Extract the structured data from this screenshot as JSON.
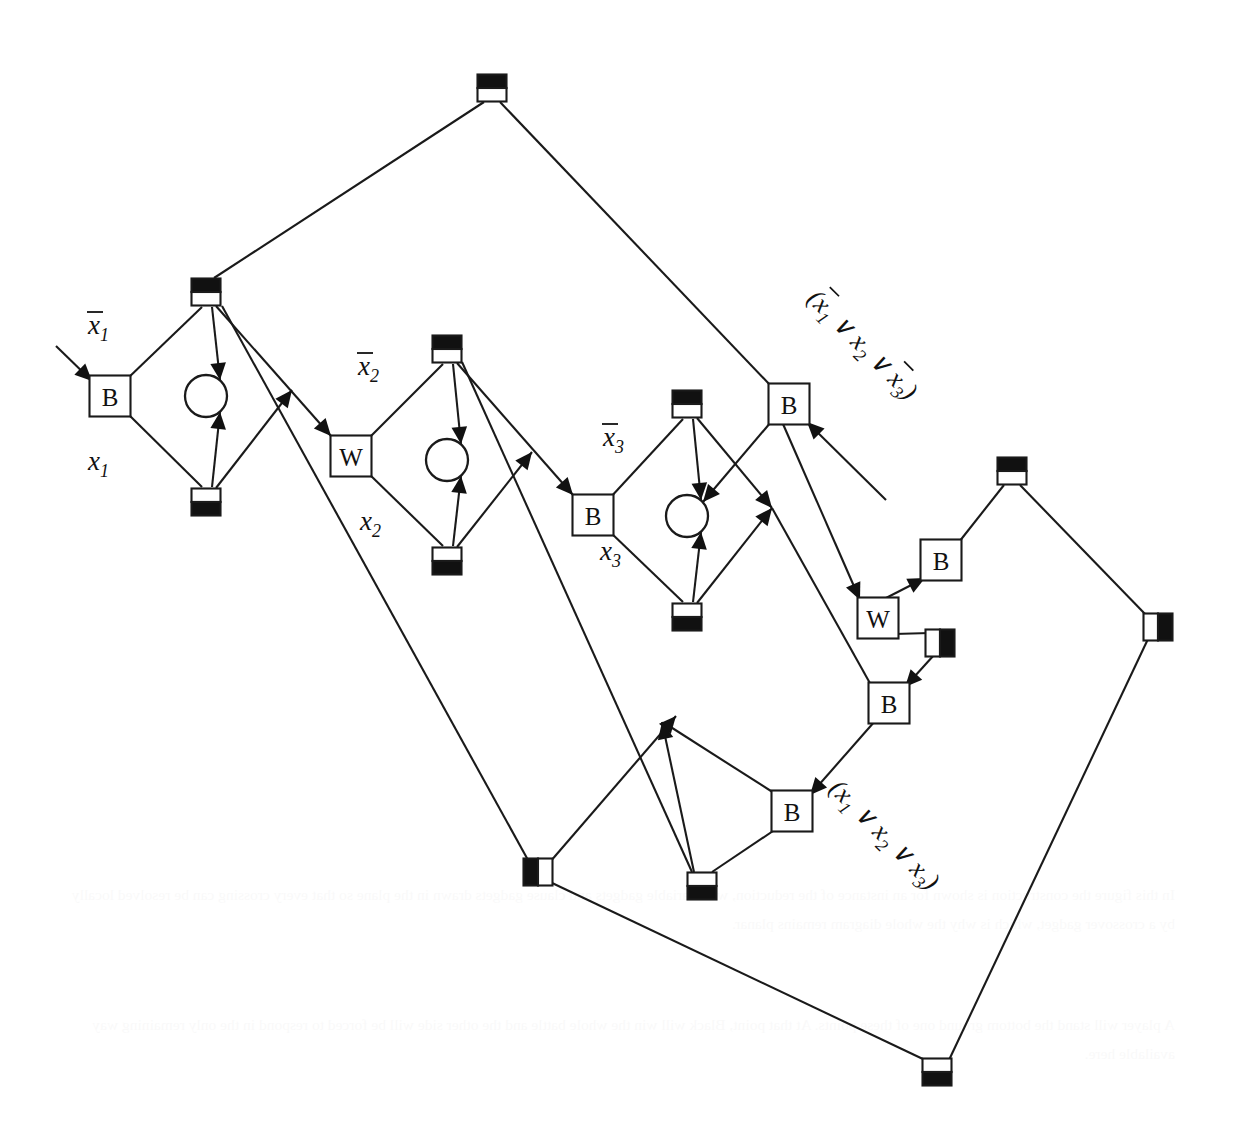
{
  "figure": {
    "kind": "sat-reduction-gadget-diagram",
    "background": "#ffffff",
    "ink": "#1a1a1a",
    "width": 1235,
    "height": 1139
  },
  "gate_labels": {
    "black": "B",
    "white": "W"
  },
  "variable_labels": [
    {
      "id": "not-x1",
      "base": "x",
      "sub": "1",
      "overline": true,
      "text": "x1",
      "x": 88,
      "y": 334
    },
    {
      "id": "x1",
      "base": "x",
      "sub": "1",
      "overline": false,
      "text": "x1",
      "x": 88,
      "y": 470
    },
    {
      "id": "not-x2",
      "base": "x",
      "sub": "2",
      "overline": true,
      "text": "x2",
      "x": 358,
      "y": 375
    },
    {
      "id": "x2",
      "base": "x",
      "sub": "2",
      "overline": false,
      "text": "x2",
      "x": 360,
      "y": 530
    },
    {
      "id": "not-x3",
      "base": "x",
      "sub": "3",
      "overline": true,
      "text": "x3",
      "x": 603,
      "y": 446
    },
    {
      "id": "x3",
      "base": "x",
      "sub": "3",
      "overline": false,
      "text": "x3",
      "x": 600,
      "y": 560
    }
  ],
  "clauses": [
    {
      "id": "clause-1",
      "text": "(x1 V x2 V x3)",
      "display": "( x̅1 ∨ x2 ∨ x̅3 )",
      "x": 806,
      "y": 300,
      "rotate": 45
    },
    {
      "id": "clause-2",
      "text": "(x1 V x2 V x3)",
      "display": "( x1 ∨ x2 ∨ x3 )",
      "x": 828,
      "y": 790,
      "rotate": 45
    }
  ],
  "gates": [
    {
      "id": "gate-b-1",
      "label": "B",
      "x": 110,
      "y": 396
    },
    {
      "id": "gate-w-1",
      "label": "W",
      "x": 351,
      "y": 456
    },
    {
      "id": "gate-b-2",
      "label": "B",
      "x": 593,
      "y": 515
    },
    {
      "id": "gate-b-3",
      "label": "B",
      "x": 789,
      "y": 404
    },
    {
      "id": "gate-b-4",
      "label": "B",
      "x": 941,
      "y": 560
    },
    {
      "id": "gate-w-2",
      "label": "W",
      "x": 878,
      "y": 618
    },
    {
      "id": "gate-b-5",
      "label": "B",
      "x": 889,
      "y": 703
    },
    {
      "id": "gate-b-6",
      "label": "B",
      "x": 792,
      "y": 811
    }
  ],
  "circles": [
    {
      "id": "circle-1",
      "x": 206,
      "y": 396,
      "r": 21
    },
    {
      "id": "circle-2",
      "x": 447,
      "y": 460,
      "r": 21
    },
    {
      "id": "circle-3",
      "x": 687,
      "y": 516,
      "r": 21
    }
  ],
  "split_nodes": [
    {
      "id": "node-top",
      "x": 492,
      "y": 88,
      "orientation": "horizontal",
      "first": "black",
      "second": "white"
    },
    {
      "id": "node-x1-upper",
      "x": 206,
      "y": 292,
      "orientation": "horizontal",
      "first": "black",
      "second": "white"
    },
    {
      "id": "node-x1-lower",
      "x": 206,
      "y": 502,
      "orientation": "horizontal",
      "first": "white",
      "second": "black"
    },
    {
      "id": "node-x2-upper",
      "x": 447,
      "y": 349,
      "orientation": "horizontal",
      "first": "black",
      "second": "white"
    },
    {
      "id": "node-x2-lower",
      "x": 447,
      "y": 561,
      "orientation": "horizontal",
      "first": "white",
      "second": "black"
    },
    {
      "id": "node-x3-upper",
      "x": 687,
      "y": 404,
      "orientation": "horizontal",
      "first": "black",
      "second": "white"
    },
    {
      "id": "node-x3-lower",
      "x": 687,
      "y": 617,
      "orientation": "horizontal",
      "first": "white",
      "second": "black"
    },
    {
      "id": "node-right-upper",
      "x": 1012,
      "y": 471,
      "orientation": "horizontal",
      "first": "black",
      "second": "white"
    },
    {
      "id": "node-right-far",
      "x": 1158,
      "y": 627,
      "orientation": "vertical",
      "first": "white",
      "second": "black"
    },
    {
      "id": "node-mid-right",
      "x": 940,
      "y": 643,
      "orientation": "vertical",
      "first": "white",
      "second": "black"
    },
    {
      "id": "node-bottom-left",
      "x": 538,
      "y": 872,
      "orientation": "vertical",
      "first": "black",
      "second": "white"
    },
    {
      "id": "node-bottom-mid",
      "x": 702,
      "y": 886,
      "orientation": "horizontal",
      "first": "white",
      "second": "black"
    },
    {
      "id": "node-bottom",
      "x": 937,
      "y": 1072,
      "orientation": "horizontal",
      "first": "white",
      "second": "black"
    }
  ],
  "input_arrow": {
    "id": "input-arrow",
    "from_x": 56,
    "from_y": 346,
    "to_x": 92,
    "to_y": 381
  },
  "ghost_text": {
    "block_upper": "",
    "block_lower_1": "will stand the battle ground one of these points. At this point, Black will win the battle",
    "block_lower_2": "white stands black and can and can and can so on all of the board"
  }
}
